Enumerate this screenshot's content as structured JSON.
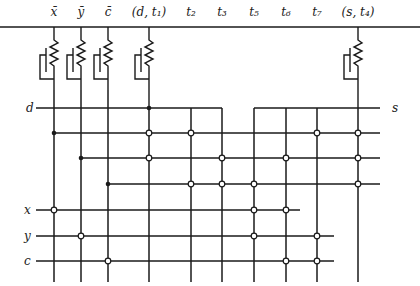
{
  "diagram": {
    "type": "transistor crossbar / PLA circuit",
    "column_labels": [
      {
        "id": "xbar",
        "label": "x̄",
        "x": 54
      },
      {
        "id": "ybar",
        "label": "ȳ",
        "x": 81
      },
      {
        "id": "cbar",
        "label": "c̄",
        "x": 108
      },
      {
        "id": "d-t1",
        "label": "(d, t₁)",
        "x": 149
      },
      {
        "id": "t2",
        "label": "t₂",
        "x": 191
      },
      {
        "id": "t3",
        "label": "t₃",
        "x": 222
      },
      {
        "id": "t5",
        "label": "t₅",
        "x": 254
      },
      {
        "id": "t6",
        "label": "t₆",
        "x": 286
      },
      {
        "id": "t7",
        "label": "t₇",
        "x": 317
      },
      {
        "id": "s-t4",
        "label": "(s, t₄)",
        "x": 358
      }
    ],
    "row_labels": {
      "d": "d",
      "s": "s",
      "x": "x",
      "y": "y",
      "c": "c"
    },
    "transistor_columns": [
      "xbar",
      "ybar",
      "cbar",
      "d-t1",
      "s-t4"
    ],
    "inputs": [
      "x",
      "y",
      "c"
    ],
    "outputs": [
      "d",
      "s"
    ]
  }
}
